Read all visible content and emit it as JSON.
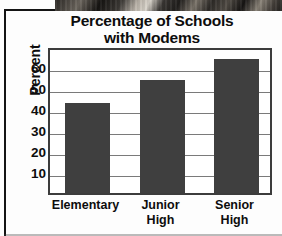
{
  "chart_data": {
    "type": "bar",
    "title": "Percentage of Schools with Modems",
    "title_line1": "Percentage of Schools",
    "title_line2": "with Modems",
    "xlabel": "",
    "ylabel": "Percent",
    "categories": [
      "Elementary",
      "Junior High",
      "Senior High"
    ],
    "category_lines": [
      {
        "line1": "Elementary",
        "line2": ""
      },
      {
        "line1": "Junior",
        "line2": "High"
      },
      {
        "line1": "Senior",
        "line2": "High"
      }
    ],
    "values": [
      43,
      54,
      64
    ],
    "ylim": [
      0,
      70
    ],
    "yticks": [
      10,
      20,
      30,
      40,
      50,
      60
    ],
    "ytick_labels": [
      "10",
      "20",
      "30",
      "40",
      "50",
      "60"
    ],
    "grid": true,
    "grid_orientation": "horizontal",
    "legend": "none",
    "bar_color": "#3f3f3f",
    "grid_color": "#7a7a7a",
    "frame_color": "#3c3c3c",
    "text_color": "#0d0d0d",
    "background_color": "#ffffff"
  },
  "page": {
    "photo_strip_label": "photo-fragment"
  }
}
